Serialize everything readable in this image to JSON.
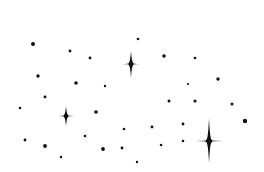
{
  "scene": {
    "description": "Hand-drawn night sky illustration: black dots and four-point sparkle stars on white background",
    "width": 264,
    "height": 172,
    "background_color": "#ffffff",
    "ink_color": "#111111"
  },
  "stars": [
    {
      "cx": 131,
      "cy": 64,
      "top": 13,
      "bottom": 14,
      "left": 9,
      "right": 9,
      "waist": 2.2
    },
    {
      "cx": 66,
      "cy": 116,
      "top": 10,
      "bottom": 10,
      "left": 9,
      "right": 9,
      "waist": 2.0
    },
    {
      "cx": 209,
      "cy": 141,
      "top": 23,
      "bottom": 22,
      "left": 14,
      "right": 15,
      "waist": 2.6
    }
  ],
  "dots": [
    {
      "x": 33,
      "y": 44,
      "r": 2.0
    },
    {
      "x": 70,
      "y": 51,
      "r": 1.4
    },
    {
      "x": 90,
      "y": 58,
      "r": 1.4
    },
    {
      "x": 38,
      "y": 76,
      "r": 1.7
    },
    {
      "x": 76,
      "y": 83,
      "r": 1.8
    },
    {
      "x": 105,
      "y": 86,
      "r": 1.2
    },
    {
      "x": 138,
      "y": 39,
      "r": 1.3
    },
    {
      "x": 164,
      "y": 56,
      "r": 1.8
    },
    {
      "x": 195,
      "y": 58,
      "r": 1.3
    },
    {
      "x": 218,
      "y": 79,
      "r": 1.7
    },
    {
      "x": 188,
      "y": 84,
      "r": 1.1
    },
    {
      "x": 45,
      "y": 97,
      "r": 1.4
    },
    {
      "x": 20,
      "y": 108,
      "r": 1.3
    },
    {
      "x": 96,
      "y": 112,
      "r": 1.8
    },
    {
      "x": 124,
      "y": 129,
      "r": 1.3
    },
    {
      "x": 85,
      "y": 136,
      "r": 1.3
    },
    {
      "x": 25,
      "y": 140,
      "r": 1.4
    },
    {
      "x": 45,
      "y": 146,
      "r": 1.9
    },
    {
      "x": 103,
      "y": 149,
      "r": 1.9
    },
    {
      "x": 122,
      "y": 148,
      "r": 1.4
    },
    {
      "x": 61,
      "y": 157,
      "r": 1.2
    },
    {
      "x": 169,
      "y": 101,
      "r": 1.5
    },
    {
      "x": 195,
      "y": 101,
      "r": 1.6
    },
    {
      "x": 232,
      "y": 104,
      "r": 1.5
    },
    {
      "x": 245,
      "y": 121,
      "r": 2.2
    },
    {
      "x": 152,
      "y": 127,
      "r": 1.4
    },
    {
      "x": 183,
      "y": 124,
      "r": 1.4
    },
    {
      "x": 183,
      "y": 141,
      "r": 1.3
    },
    {
      "x": 161,
      "y": 145,
      "r": 1.3
    },
    {
      "x": 137,
      "y": 162,
      "r": 1.2
    }
  ]
}
